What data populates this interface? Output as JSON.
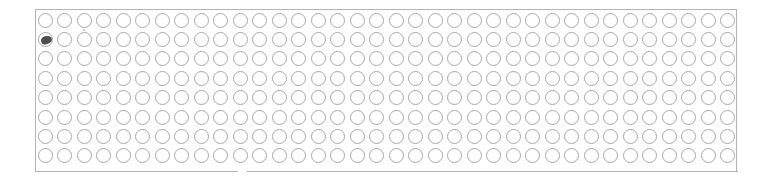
{
  "sheet": {
    "rows": 8,
    "columns": 36,
    "bubble_color": "#a9a9a9",
    "border_color": "#b4b4b4",
    "mark_color": "#3a3a3a",
    "filled": [
      {
        "row": 2,
        "column": 1
      }
    ]
  }
}
